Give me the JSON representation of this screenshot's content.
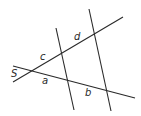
{
  "diagram": {
    "type": "transversal-lines",
    "lines": [
      {
        "id": "upper-transversal",
        "x1": 13,
        "y1": 82,
        "x2": 123,
        "y2": 17
      },
      {
        "id": "lower-transversal",
        "x1": 13,
        "y1": 66,
        "x2": 135,
        "y2": 98
      },
      {
        "id": "left-line",
        "x1": 56,
        "y1": 28,
        "x2": 74,
        "y2": 110
      },
      {
        "id": "right-line",
        "x1": 89,
        "y1": 9,
        "x2": 111,
        "y2": 111
      }
    ],
    "labels": {
      "s": "S",
      "a": "a",
      "b": "b",
      "c": "c",
      "d": "d"
    },
    "colors": {
      "stroke": "#2a2a2a",
      "background": "#ffffff"
    }
  }
}
